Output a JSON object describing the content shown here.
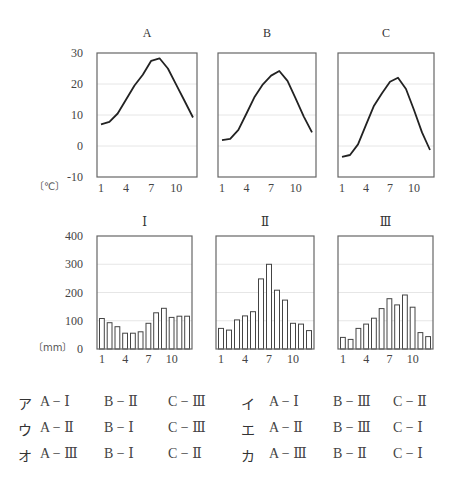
{
  "chart_data": [
    {
      "type": "line",
      "title": "A",
      "x": [
        1,
        2,
        3,
        4,
        5,
        6,
        7,
        8,
        9,
        10,
        11,
        12
      ],
      "values": [
        7.0,
        7.8,
        10.5,
        15.0,
        19.5,
        23.0,
        27.5,
        28.3,
        25.0,
        19.7,
        14.5,
        9.2
      ],
      "xlabel": "",
      "ylabel": "[℃]",
      "ylim": [
        -10,
        30
      ],
      "yticks": [
        30,
        20,
        10,
        0,
        -10
      ],
      "xticks": [
        1,
        4,
        7,
        10
      ]
    },
    {
      "type": "line",
      "title": "B",
      "x": [
        1,
        2,
        3,
        4,
        5,
        6,
        7,
        8,
        9,
        10,
        11,
        12
      ],
      "values": [
        1.9,
        2.3,
        5.2,
        10.5,
        15.9,
        19.9,
        22.7,
        24.2,
        21.0,
        15.4,
        9.5,
        4.4
      ],
      "ylim": [
        -10,
        30
      ],
      "xticks": [
        1,
        4,
        7,
        10
      ]
    },
    {
      "type": "line",
      "title": "C",
      "x": [
        1,
        2,
        3,
        4,
        5,
        6,
        7,
        8,
        9,
        10,
        11,
        12
      ],
      "values": [
        -3.5,
        -2.9,
        0.5,
        6.8,
        13.0,
        17.0,
        20.7,
        22.0,
        18.4,
        11.6,
        4.4,
        -1.3
      ],
      "ylim": [
        -10,
        30
      ],
      "xticks": [
        1,
        4,
        7,
        10
      ]
    },
    {
      "type": "bar",
      "title": "Ⅰ",
      "categories": [
        1,
        2,
        3,
        4,
        5,
        6,
        7,
        8,
        9,
        10,
        11,
        12
      ],
      "values": [
        108,
        93,
        79,
        56,
        56,
        61,
        91,
        128,
        144,
        112,
        116,
        116
      ],
      "ylabel": "[mm]",
      "ylim": [
        0,
        400
      ],
      "yticks": [
        400,
        300,
        200,
        100,
        0
      ],
      "xticks": [
        1,
        4,
        7,
        10
      ]
    },
    {
      "type": "bar",
      "title": "Ⅱ",
      "categories": [
        1,
        2,
        3,
        4,
        5,
        6,
        7,
        8,
        9,
        10,
        11,
        12
      ],
      "values": [
        73,
        67,
        103,
        117,
        132,
        248,
        300,
        208,
        173,
        91,
        88,
        65
      ],
      "ylim": [
        0,
        400
      ],
      "xticks": [
        1,
        4,
        7,
        10
      ]
    },
    {
      "type": "bar",
      "title": "Ⅲ",
      "categories": [
        1,
        2,
        3,
        4,
        5,
        6,
        7,
        8,
        9,
        10,
        11,
        12
      ],
      "values": [
        41,
        34,
        73,
        88,
        109,
        143,
        178,
        156,
        191,
        148,
        58,
        44
      ],
      "ylim": [
        0,
        400
      ],
      "xticks": [
        1,
        4,
        7,
        10
      ]
    }
  ],
  "temp_axis": {
    "ticks": [
      "30",
      "20",
      "10",
      "0",
      "-10"
    ],
    "unit": "〔℃〕"
  },
  "precip_axis": {
    "ticks": [
      "400",
      "300",
      "200",
      "100",
      "0"
    ],
    "unit": "〔mm〕"
  },
  "x_ticks": [
    "1",
    "4",
    "7",
    "10"
  ],
  "titles": {
    "A": "A",
    "B": "B",
    "C": "C",
    "I": "Ⅰ",
    "II": "Ⅱ",
    "III": "Ⅲ"
  },
  "choices": [
    [
      {
        "key": "ア",
        "a": "A − Ⅰ",
        "b": "B − Ⅱ",
        "c": "C − Ⅲ"
      },
      {
        "key": "イ",
        "a": "A − Ⅰ",
        "b": "B − Ⅲ",
        "c": "C − Ⅱ"
      }
    ],
    [
      {
        "key": "ウ",
        "a": "A − Ⅱ",
        "b": "B − Ⅰ",
        "c": "C − Ⅲ"
      },
      {
        "key": "エ",
        "a": "A − Ⅱ",
        "b": "B − Ⅲ",
        "c": "C − Ⅰ"
      }
    ],
    [
      {
        "key": "オ",
        "a": "A − Ⅲ",
        "b": "B − Ⅰ",
        "c": "C − Ⅱ"
      },
      {
        "key": "カ",
        "a": "A − Ⅲ",
        "b": "B − Ⅱ",
        "c": "C − Ⅰ"
      }
    ]
  ]
}
